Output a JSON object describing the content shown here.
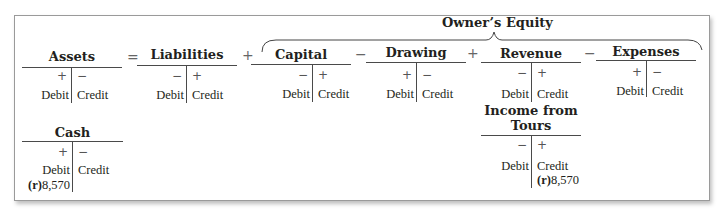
{
  "diagram": {
    "group_label": "Owner’s Equity",
    "operators": {
      "equals": "=",
      "plus1": "+",
      "minus1": "−",
      "plus2": "+",
      "minus2": "−"
    },
    "accounts": [
      {
        "name": "Assets",
        "left_sign": "+",
        "right_sign": "−",
        "left_label": "Debit",
        "right_label": "Credit"
      },
      {
        "name": "Liabilities",
        "left_sign": "−",
        "right_sign": "+",
        "left_label": "Debit",
        "right_label": "Credit"
      },
      {
        "name": "Capital",
        "left_sign": "−",
        "right_sign": "+",
        "left_label": "Debit",
        "right_label": "Credit"
      },
      {
        "name": "Drawing",
        "left_sign": "+",
        "right_sign": "−",
        "left_label": "Debit",
        "right_label": "Credit"
      },
      {
        "name": "Revenue",
        "left_sign": "−",
        "right_sign": "+",
        "left_label": "Debit",
        "right_label": "Credit"
      },
      {
        "name": "Expenses",
        "left_sign": "+",
        "right_sign": "−",
        "left_label": "Debit",
        "right_label": "Credit"
      }
    ],
    "sub_accounts": [
      {
        "name": "Cash",
        "left_sign": "+",
        "right_sign": "−",
        "left_label": "Debit",
        "right_label": "Credit",
        "entry_side": "debit",
        "entry_ref": "(r)",
        "entry_amount": "8,570"
      },
      {
        "name_line1": "Income from",
        "name_line2": "Tours",
        "left_sign": "−",
        "right_sign": "+",
        "left_label": "Debit",
        "right_label": "Credit",
        "entry_side": "credit",
        "entry_ref": "(r)",
        "entry_amount": "8,570"
      }
    ]
  }
}
